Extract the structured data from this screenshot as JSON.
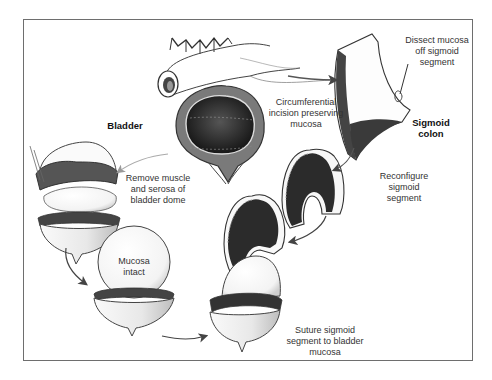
{
  "diagram": {
    "labels": {
      "bladder": "Bladder",
      "sigmoid_colon": "Sigmoid\ncolon",
      "circumferential_incision": "Circumferential\nincision preserving\nmucosa",
      "dissect_mucosa": "Dissect mucosa\noff sigmoid\nsegment",
      "remove_muscle": "Remove muscle\nand serosa of\nbladder dome",
      "reconfigure": "Reconfigure\nsigmoid\nsegment",
      "mucosa_intact": "Mucosa\nintact",
      "suture": "Suture sigmoid\nsegment to bladder\nmucosa"
    },
    "steps": [
      {
        "id": "bladder-and-colon",
        "description": "Bladder with sigmoid colon above"
      },
      {
        "id": "dissect-sigmoid",
        "description": "Dissect mucosa off sigmoid segment"
      },
      {
        "id": "reconfigure-sigmoid",
        "description": "Reconfigure sigmoid segment"
      },
      {
        "id": "remove-bladder-dome",
        "description": "Remove muscle and serosa of bladder dome"
      },
      {
        "id": "mucosa-intact",
        "description": "Mucosa intact"
      },
      {
        "id": "suture",
        "description": "Suture sigmoid segment to bladder mucosa"
      }
    ],
    "colors": {
      "line": "#3a3a3a",
      "dark_fill": "#2a2a2a",
      "mid_fill": "#6a6a6a",
      "light_fill": "#f4f4f4",
      "arrow": "#555555",
      "frame": "#6e6e6e"
    }
  }
}
